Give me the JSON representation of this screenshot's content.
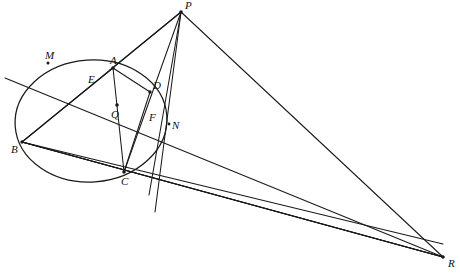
{
  "figure": {
    "background_color": "#ffffff",
    "stroke_color": "#1a1a1a",
    "width": 460,
    "height": 274
  },
  "conic": {
    "name": "circle",
    "center_x": 91,
    "center_y": 121,
    "radius_x": 76,
    "radius_y": 61,
    "rotation_deg": -4
  },
  "points": [
    {
      "id": "P",
      "label": "P",
      "x": 181,
      "y": 12,
      "label_dx": 4,
      "label_dy": -12,
      "on_conic": false,
      "dot": true
    },
    {
      "id": "M",
      "label": "M",
      "x": 48,
      "y": 63,
      "label_dx": -3,
      "label_dy": -13,
      "on_conic": true,
      "dot": true
    },
    {
      "id": "A",
      "label": "A",
      "x": 113,
      "y": 68,
      "label_dx": -3,
      "label_dy": -13,
      "on_conic": true,
      "dot": true
    },
    {
      "id": "E",
      "label": "E",
      "x": 100,
      "y": 85,
      "label_dx": -12,
      "label_dy": -11,
      "on_conic": false,
      "dot": false
    },
    {
      "id": "D",
      "label": "D",
      "x": 150,
      "y": 92,
      "label_dx": 3,
      "label_dy": -12,
      "on_conic": true,
      "dot": true
    },
    {
      "id": "Q",
      "label": "Q",
      "x": 117,
      "y": 105,
      "label_dx": -6,
      "label_dy": 4,
      "on_conic": false,
      "dot": true
    },
    {
      "id": "F",
      "label": "F",
      "x": 147,
      "y": 111,
      "label_dx": 2,
      "label_dy": 1,
      "on_conic": false,
      "dot": false
    },
    {
      "id": "N",
      "label": "N",
      "x": 169,
      "y": 124,
      "label_dx": 3,
      "label_dy": 0,
      "on_conic": true,
      "dot": true
    },
    {
      "id": "B",
      "label": "B",
      "x": 22,
      "y": 142,
      "label_dx": -11,
      "label_dy": 2,
      "on_conic": true,
      "dot": true
    },
    {
      "id": "C",
      "label": "C",
      "x": 124,
      "y": 172,
      "label_dx": -3,
      "label_dy": 8,
      "on_conic": true,
      "dot": true
    },
    {
      "id": "R",
      "label": "R",
      "x": 443,
      "y": 257,
      "label_dx": 5,
      "label_dy": 3,
      "on_conic": false,
      "dot": true
    }
  ],
  "segments": [
    {
      "id": "P-to-Mline",
      "name": "line-p-m-b",
      "x1": 181,
      "y1": 12,
      "x2": 22,
      "y2": 142
    },
    {
      "id": "P-to-A",
      "name": "line-p-a",
      "x1": 181,
      "y1": 12,
      "x2": 113,
      "y2": 68
    },
    {
      "id": "P-to-Q-C",
      "name": "line-p-q-c",
      "x1": 181,
      "y1": 12,
      "x2": 124,
      "y2": 172
    },
    {
      "id": "P-to-AC",
      "name": "line-p-a-c",
      "x1": 181,
      "y1": 12,
      "x2": 113,
      "y2": 68
    },
    {
      "id": "P-to-D",
      "name": "line-p-d-n",
      "x1": 181,
      "y1": 12,
      "x2": 155,
      "y2": 212
    },
    {
      "id": "P-to-R",
      "name": "line-p-r",
      "x1": 181,
      "y1": 12,
      "x2": 443,
      "y2": 257
    },
    {
      "id": "M-to-R",
      "name": "line-m-e-q-f-n-r",
      "x1": 5,
      "y1": 78,
      "x2": 443,
      "y2": 257
    },
    {
      "id": "B-to-A",
      "name": "line-b-a-p",
      "x1": 22,
      "y1": 142,
      "x2": 113,
      "y2": 68
    },
    {
      "id": "B-to-D",
      "name": "line-b-q-d-r",
      "x1": 22,
      "y1": 142,
      "x2": 443,
      "y2": 257
    },
    {
      "id": "B-to-C",
      "name": "line-b-c-r",
      "x1": 22,
      "y1": 142,
      "x2": 443,
      "y2": 257
    },
    {
      "id": "A-to-C",
      "name": "chord-a-c",
      "x1": 113,
      "y1": 68,
      "x2": 124,
      "y2": 172
    },
    {
      "id": "D-to-C",
      "name": "chord-d-c",
      "x1": 150,
      "y1": 92,
      "x2": 124,
      "y2": 172
    },
    {
      "id": "A-to-D",
      "name": "chord-a-d",
      "x1": 113,
      "y1": 68,
      "x2": 150,
      "y2": 92
    }
  ],
  "labels_meta": {
    "font_style": "italic-serif",
    "font_size_px": 11,
    "color": "#111111"
  }
}
